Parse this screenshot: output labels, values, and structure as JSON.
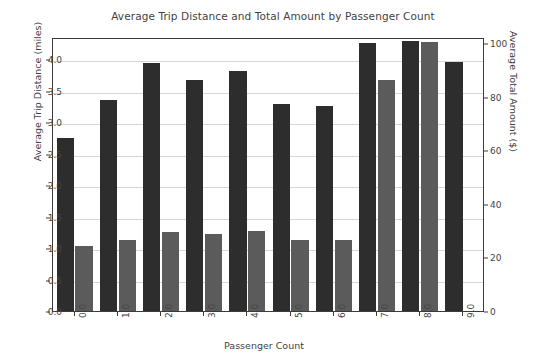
{
  "chart_data": {
    "type": "bar",
    "title": "Average Trip Distance and Total Amount by Passenger Count",
    "xlabel": "Passenger Count",
    "ylabel": "Average Trip Distance (miles)",
    "ylabel_secondary": "Average Total Amount ($)",
    "categories": [
      "0.0",
      "1.0",
      "2.0",
      "3.0",
      "4.0",
      "5.0",
      "6.0",
      "7.0",
      "8.0",
      "9.0"
    ],
    "series": [
      {
        "name": "Average Trip Distance (miles)",
        "axis": "left",
        "color": "#2d2d2d",
        "values": [
          2.75,
          3.35,
          3.93,
          3.67,
          3.81,
          3.29,
          3.26,
          4.25,
          4.28,
          3.95
        ]
      },
      {
        "name": "Average Total Amount ($)",
        "axis": "right",
        "color": "#5b5b5b",
        "values": [
          24.2,
          26.6,
          29.6,
          28.7,
          30.0,
          26.6,
          26.6,
          86.3,
          100.5,
          null
        ]
      }
    ],
    "ylim": [
      0.0,
      4.35
    ],
    "ylim_secondary": [
      0,
      102.3
    ],
    "yticks": [
      "0.0",
      "0.5",
      "1.0",
      "1.5",
      "2.0",
      "2.5",
      "3.0",
      "3.5",
      "4.0"
    ],
    "ytick_values": [
      0.0,
      0.5,
      1.0,
      1.5,
      2.0,
      2.5,
      3.0,
      3.5,
      4.0
    ],
    "yticks_secondary": [
      "0",
      "20",
      "40",
      "60",
      "80",
      "100"
    ],
    "ytick_values_secondary": [
      0,
      20,
      40,
      60,
      80,
      100
    ],
    "grid": true,
    "legend": "none"
  }
}
